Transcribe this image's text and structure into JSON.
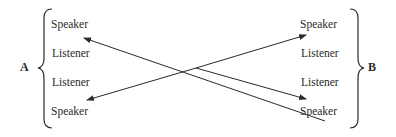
{
  "diagram": {
    "group_a": {
      "label": "A",
      "items": [
        "Speaker",
        "Listener",
        "Listener",
        "Speaker"
      ]
    },
    "group_b": {
      "label": "B",
      "items": [
        "Speaker",
        "Listener",
        "Listener",
        "Speaker"
      ]
    },
    "arrows": [
      {
        "from": "B.Speaker(bottom)",
        "to": "A.Speaker(top)"
      },
      {
        "from": "A.Speaker(bottom)",
        "to": "B.Speaker(top)",
        "bidirectional_endpoints": true
      }
    ],
    "colors": {
      "ink": "#2a2a2a",
      "background": "#ffffff"
    }
  }
}
